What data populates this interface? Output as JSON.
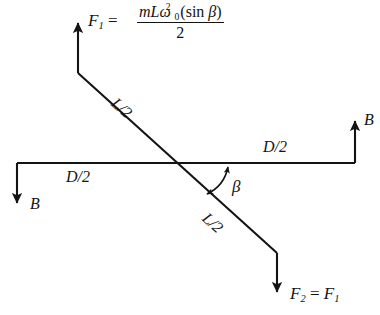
{
  "figure": {
    "background_color": "#ffffff",
    "line_color": "#141414",
    "labels": {
      "f1": "F",
      "f1_subscript": "1",
      "f1_equals": " = ",
      "formula_numerator_m": "mL",
      "formula_omega": "ω",
      "formula_omega_subscript": "0",
      "formula_omega_superscript": "2",
      "formula_sin": "(sin ",
      "formula_beta": "β",
      "formula_close": ")",
      "formula_denominator": "2",
      "b_left": "B",
      "b_right": "B",
      "d_left": "D/2",
      "d_right": "D/2",
      "l_upper": "L/2",
      "l_lower": "L/2",
      "beta": "β",
      "f2": "F",
      "f2_subscript": "2",
      "f2_equals": " = ",
      "f2_rhs": "F",
      "f2_rhs_subscript": "1"
    },
    "geometry": {
      "crossing_point": [
        180,
        163
      ],
      "diagonal_start": [
        78,
        73
      ],
      "diagonal_end": [
        277,
        253
      ],
      "horizontal_y": 163,
      "horizontal_start_x": 17,
      "horizontal_end_x": 355,
      "f1_arrow_x": 78,
      "f1_arrow_tip_y": 18,
      "f2_arrow_x": 277,
      "f2_arrow_tip_y": 297,
      "b_left_arrow_x": 17,
      "b_left_arrow_tip_y": 207,
      "b_right_arrow_x": 355,
      "b_right_arrow_tip_y": 117,
      "beta_angle_degrees": 42
    }
  }
}
